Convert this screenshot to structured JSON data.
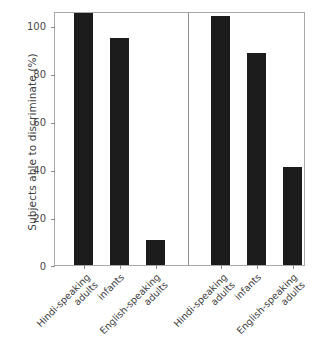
{
  "chart_data": {
    "type": "bar",
    "title": "",
    "xlabel": "",
    "ylabel": "Subjects able to discriminate (%)",
    "ylim": [
      0,
      100
    ],
    "yticks": [
      0,
      20,
      40,
      60,
      80,
      100
    ],
    "ytick_labels": [
      "0",
      "20",
      "40",
      "60",
      "80",
      "100"
    ],
    "grid": false,
    "legend": false,
    "panels": [
      {
        "name": "left-panel",
        "categories": [
          "Hindi-speaking adults",
          "infants",
          "English-speaking adults"
        ],
        "values": [
          100,
          90,
          10
        ]
      },
      {
        "name": "right-panel",
        "categories": [
          "Hindi-speaking adults",
          "infants",
          "English-speaking adults"
        ],
        "values": [
          99,
          84,
          39
        ]
      }
    ],
    "bar_color": "#1c1c1c",
    "frame_color": "#a8a8a8",
    "background": "#ffffff"
  },
  "axis": {
    "y_title": "Subjects able to discriminate (%)",
    "ticks": {
      "t100": "100",
      "t80": "80",
      "t60": "60",
      "t40": "40",
      "t20": "20",
      "t0": "0"
    }
  },
  "categories": {
    "hindi_line1": "Hindi-speaking",
    "hindi_line2": "adults",
    "infants": "infants",
    "english_line1": "English-speaking",
    "english_line2": "adults"
  }
}
